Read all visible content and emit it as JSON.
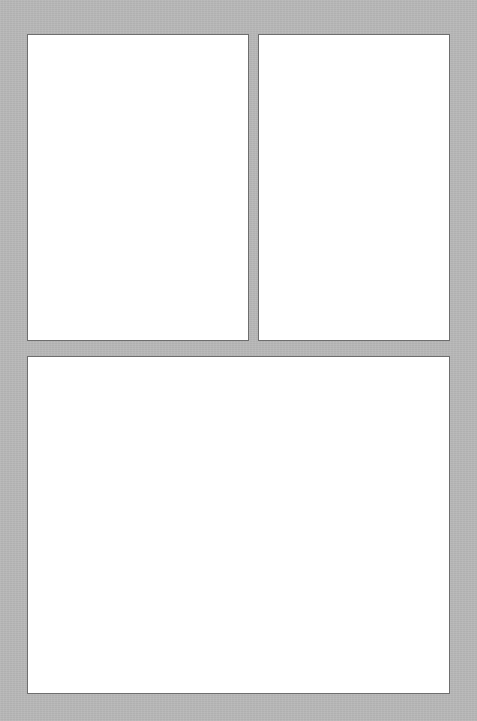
{
  "page": {
    "width": 477,
    "height": 721,
    "background_color": "#b8b8b8",
    "panel_fill_color": "#ffffff",
    "panel_border_color": "#6e6e6e"
  },
  "panels": [
    {
      "name": "top-left-panel",
      "content": "",
      "x": 27,
      "y": 34,
      "width": 222,
      "height": 307
    },
    {
      "name": "top-right-panel",
      "content": "",
      "x": 258,
      "y": 34,
      "width": 192,
      "height": 307
    },
    {
      "name": "bottom-panel",
      "content": "",
      "x": 27,
      "y": 356,
      "width": 423,
      "height": 338
    }
  ]
}
